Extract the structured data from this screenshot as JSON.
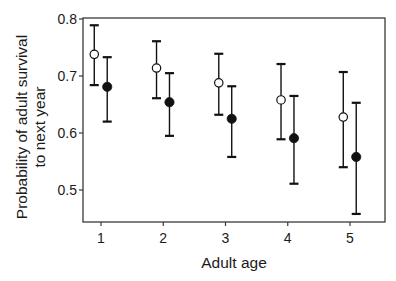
{
  "chart_data": {
    "type": "scatter",
    "subtype": "point-with-error-bars",
    "title": "",
    "xlabel": "Adult age",
    "ylabel_lines": [
      "Probability of adult survival",
      "to next year"
    ],
    "ylabel": "Probability of adult survival to next year",
    "categories": [
      "1",
      "2",
      "3",
      "4",
      "5"
    ],
    "x": [
      1,
      2,
      3,
      4,
      5
    ],
    "xlim": [
      0.55,
      5.6
    ],
    "ylim": [
      0.444,
      0.8
    ],
    "yticks": [
      0.5,
      0.6,
      0.7,
      0.8
    ],
    "ytick_labels": [
      "0.5",
      "0.6",
      "0.7",
      "0.8"
    ],
    "xticks": [
      1,
      2,
      3,
      4,
      5
    ],
    "xtick_labels": [
      "1",
      "2",
      "3",
      "4",
      "5"
    ],
    "grid": false,
    "legend": null,
    "series": [
      {
        "name": "open circles",
        "marker": "open-circle",
        "offset": -0.1,
        "values": [
          0.738,
          0.714,
          0.688,
          0.658,
          0.628
        ],
        "upper": [
          0.789,
          0.761,
          0.739,
          0.721,
          0.707
        ],
        "lower": [
          0.684,
          0.661,
          0.632,
          0.589,
          0.54
        ]
      },
      {
        "name": "filled circles",
        "marker": "filled-circle",
        "offset": 0.1,
        "values": [
          0.681,
          0.654,
          0.625,
          0.591,
          0.558
        ],
        "upper": [
          0.733,
          0.705,
          0.682,
          0.665,
          0.653
        ],
        "lower": [
          0.62,
          0.595,
          0.558,
          0.511,
          0.458
        ]
      }
    ]
  },
  "colors": {
    "axis": "#3a3a3a",
    "marker": "#111111",
    "background": "#ffffff"
  }
}
